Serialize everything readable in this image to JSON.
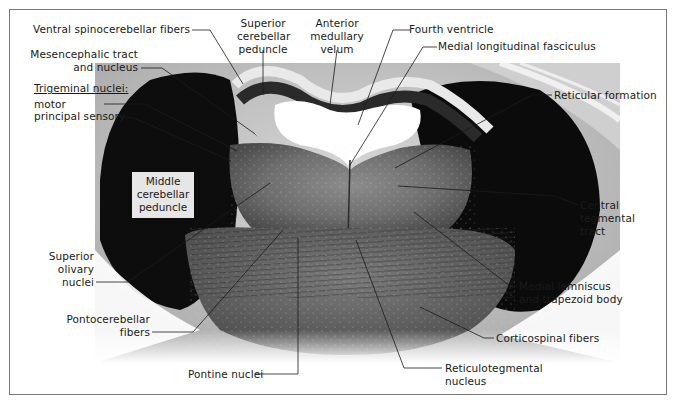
{
  "figure": {
    "colors": {
      "frame": "#7a7a7a",
      "label_text": "#1a1a1a",
      "box_label_bg": "#e6e6e6"
    }
  },
  "labels": {
    "ventral_spinocerebellar": "Ventral spinocerebellar fibers",
    "superior_cerebellar_peduncle": [
      "Superior",
      "cerebellar",
      "peduncle"
    ],
    "anterior_medullary_velum": [
      "Anterior",
      "medullary",
      "velum"
    ],
    "fourth_ventricle": "Fourth ventricle",
    "medial_longitudinal_fasciculus": "Medial longitudinal fasciculus",
    "mesencephalic_tract": [
      "Mesencephalic tract",
      "and nucleus"
    ],
    "trigeminal_heading": "Trigeminal nuclei:",
    "trigeminal_motor": "motor",
    "trigeminal_principal_sensory": "principal sensory",
    "reticular_formation": "Reticular formation",
    "middle_cerebellar_peduncle": [
      "Middle",
      "cerebellar",
      "peduncle"
    ],
    "central_tegmental_tract": [
      "Central",
      "tegmental",
      "tract"
    ],
    "superior_olivary_nuclei": [
      "Superior",
      "olivary",
      "nuclei"
    ],
    "medial_lemniscus": [
      "Medial lemniscus",
      "and trapezoid body"
    ],
    "pontocerebellar_fibers": [
      "Pontocerebellar",
      "fibers"
    ],
    "corticospinal_fibers": "Corticospinal fibers",
    "pontine_nuclei": "Pontine nuclei",
    "reticulotegmental_nucleus": [
      "Reticulotegmental",
      "nucleus"
    ]
  }
}
